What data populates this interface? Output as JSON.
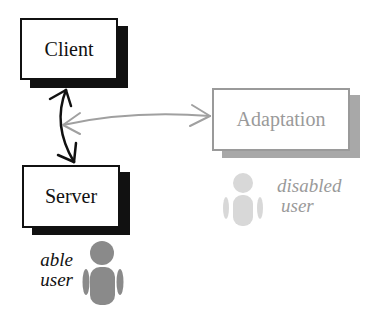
{
  "diagram": {
    "nodes": [
      {
        "id": "client",
        "label": "Client",
        "color": "#111111",
        "shadow": "#111111"
      },
      {
        "id": "server",
        "label": "Server",
        "color": "#111111",
        "shadow": "#111111"
      },
      {
        "id": "adaptation",
        "label": "Adaptation",
        "color": "#9a9a9a",
        "shadow": "#a8a8a8"
      }
    ],
    "edges": [
      {
        "from": "client",
        "to": "server",
        "style": "bidirectional",
        "color": "#111111"
      },
      {
        "from": "client-server-link",
        "to": "adaptation",
        "style": "bidirectional",
        "color": "#a0a0a0"
      }
    ],
    "users": [
      {
        "id": "able",
        "line1": "able",
        "line2": "user",
        "color": "#8a8a8a",
        "text_color": "#111111"
      },
      {
        "id": "disabled",
        "line1": "disabled",
        "line2": "user",
        "color": "#d8d8d8",
        "text_color": "#9a9a9a"
      }
    ]
  }
}
